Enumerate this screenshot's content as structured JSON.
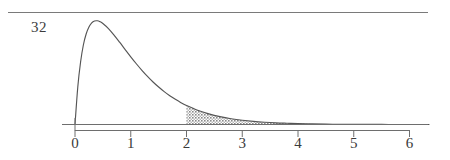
{
  "figure": {
    "name": "right-skewed-density-with-shaded-tail",
    "peak_label": "32",
    "top_rule": true
  },
  "chart_data": {
    "type": "line",
    "title": "",
    "subtitle": "",
    "xlabel": "",
    "ylabel": "",
    "xlim": [
      -0.25,
      6.35
    ],
    "ylim": [
      0,
      1.12
    ],
    "grid": false,
    "legend": null,
    "annotations": [
      {
        "text": "32",
        "x": -0.75,
        "y": 1.0,
        "role": "peak-height-label"
      }
    ],
    "axis": {
      "x_ticks": [
        0,
        1,
        2,
        3,
        4,
        5,
        6
      ],
      "x_tick_labels": [
        "0",
        "1",
        "2",
        "3",
        "4",
        "5",
        "6"
      ],
      "y_ticks": [],
      "y_tick_labels": [],
      "baseline_y": 0
    },
    "shaded_region": {
      "label": "tail area",
      "from_x": 2,
      "to_x": 6.35,
      "fill": "stipple-gray",
      "fill_color": "#8c8c8c"
    },
    "series": [
      {
        "name": "density",
        "color": "#555555",
        "x": [
          0.0,
          0.05,
          0.1,
          0.15,
          0.2,
          0.25,
          0.3,
          0.35,
          0.4,
          0.45,
          0.5,
          0.6,
          0.7,
          0.8,
          0.9,
          1.0,
          1.1,
          1.2,
          1.3,
          1.4,
          1.5,
          1.6,
          1.7,
          1.8,
          1.9,
          2.0,
          2.2,
          2.4,
          2.6,
          2.8,
          3.0,
          3.2,
          3.4,
          3.6,
          3.8,
          4.0,
          4.25,
          4.5,
          4.75,
          5.0,
          5.25,
          5.5,
          5.75,
          6.0,
          6.35
        ],
        "y": [
          0.0,
          0.363,
          0.604,
          0.768,
          0.874,
          0.942,
          0.982,
          1.0,
          1.002,
          0.993,
          0.976,
          0.927,
          0.864,
          0.795,
          0.724,
          0.654,
          0.587,
          0.524,
          0.465,
          0.411,
          0.362,
          0.318,
          0.278,
          0.243,
          0.211,
          0.184,
          0.138,
          0.103,
          0.076,
          0.056,
          0.041,
          0.03,
          0.022,
          0.016,
          0.012,
          0.0085,
          0.0055,
          0.0036,
          0.0023,
          0.0015,
          0.0009,
          0.0006,
          0.0004,
          0.00025,
          0.00015
        ]
      }
    ]
  },
  "colors": {
    "curve": "#555555",
    "axis": "#6e6e6e",
    "rule": "#7a7a7a",
    "text": "#3a3a3a",
    "shade": "#8c8c8c"
  }
}
